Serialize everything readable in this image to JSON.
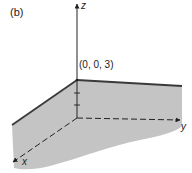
{
  "figure": {
    "panel_label": "(b)",
    "point_label": "(0, 0, 3)",
    "axes": {
      "x_label": "x",
      "y_label": "y",
      "z_label": "z"
    },
    "colors": {
      "plane_fill": "#c4c4c4",
      "edge": "#3a3a3a",
      "axis": "#222222",
      "background": "#ffffff"
    }
  }
}
